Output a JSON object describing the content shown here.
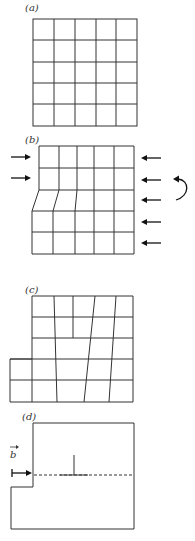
{
  "panels": {
    "a": {
      "label": "(a)",
      "description": "undeformed 5x5 square grid"
    },
    "b": {
      "label": "(b)",
      "description": "grid under compressive forces with shear offset in lower rows"
    },
    "c": {
      "label": "(c)",
      "description": "grid after slip with step on lower left"
    },
    "d": {
      "label": "(d)",
      "description": "edge dislocation with Burgers vector"
    }
  },
  "burgers_vector_label": "b",
  "colors": {
    "line": "#333333",
    "arrow": "#111111",
    "background": "#ffffff"
  }
}
